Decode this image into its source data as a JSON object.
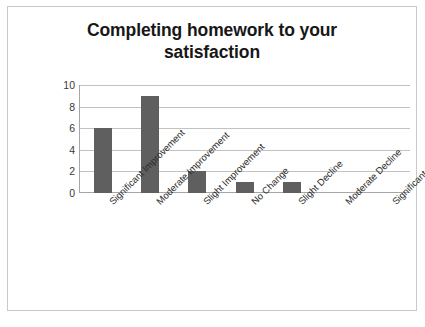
{
  "chart_data": {
    "type": "bar",
    "title": "Completing homework to your satisfaction",
    "title_lines": [
      "Completing homework to your",
      "satisfaction"
    ],
    "categories": [
      "Significant Improvement",
      "Moderate Improvement",
      "Slight Improvement",
      "No Change",
      "Slight Decline",
      "Moderate Decline",
      "Significant Decline"
    ],
    "values": [
      6,
      9,
      2,
      1,
      1,
      0,
      0
    ],
    "xlabel": "",
    "ylabel": "",
    "ylim": [
      0,
      10
    ],
    "yticks": [
      0,
      2,
      4,
      6,
      8,
      10
    ],
    "ytick_labels": [
      "0",
      "2",
      "4",
      "6",
      "8",
      "10"
    ],
    "grid": true,
    "legend": false,
    "bar_color": "#5f5f5f",
    "gridline_color": "#c2c2c2",
    "axis_color": "#a6a6a6",
    "border_color": "#c9c9c9",
    "background": "#ffffff"
  }
}
